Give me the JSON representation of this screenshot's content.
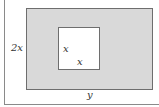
{
  "diagram": {
    "outer_rectangle": {
      "height_label": "2x",
      "width_label": "y",
      "fill": "#d9d9d9"
    },
    "inner_square": {
      "side_label_left": "x",
      "side_label_bottom": "x",
      "fill": "#ffffff"
    },
    "stroke_color": "#6e6e6e"
  }
}
